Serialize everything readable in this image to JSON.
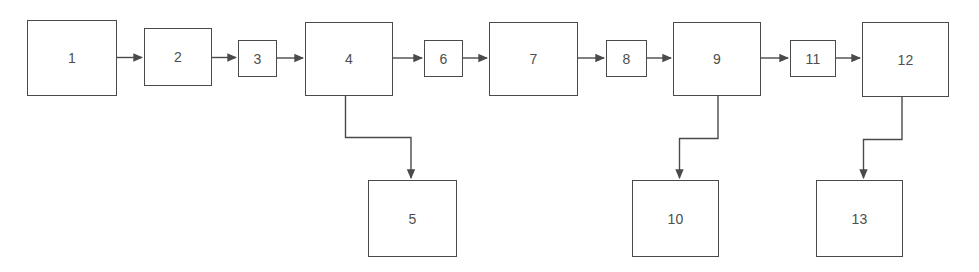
{
  "diagram": {
    "type": "flowchart",
    "orientation": "left-to-right with downward branches",
    "background_color": "#ffffff",
    "line_color": "#4a4a4a",
    "text_color": "#4e4e4e",
    "nodes": [
      {
        "id": "n1",
        "label": "1",
        "x": 27,
        "y": 20,
        "w": 90,
        "h": 76,
        "shape": "rectangle"
      },
      {
        "id": "n2",
        "label": "2",
        "x": 144,
        "y": 28,
        "w": 68,
        "h": 58,
        "shape": "rectangle"
      },
      {
        "id": "n3",
        "label": "3",
        "x": 238,
        "y": 40,
        "w": 39,
        "h": 37,
        "shape": "rectangle"
      },
      {
        "id": "n4",
        "label": "4",
        "x": 305,
        "y": 22,
        "w": 88,
        "h": 74,
        "shape": "rectangle"
      },
      {
        "id": "n5",
        "label": "5",
        "x": 368,
        "y": 180,
        "w": 89,
        "h": 77,
        "shape": "rectangle"
      },
      {
        "id": "n6",
        "label": "6",
        "x": 424,
        "y": 40,
        "w": 39,
        "h": 37,
        "shape": "rectangle"
      },
      {
        "id": "n7",
        "label": "7",
        "x": 489,
        "y": 22,
        "w": 89,
        "h": 74,
        "shape": "rectangle"
      },
      {
        "id": "n8",
        "label": "8",
        "x": 606,
        "y": 40,
        "w": 41,
        "h": 37,
        "shape": "rectangle"
      },
      {
        "id": "n9",
        "label": "9",
        "x": 673,
        "y": 22,
        "w": 88,
        "h": 74,
        "shape": "rectangle"
      },
      {
        "id": "n10",
        "label": "10",
        "x": 632,
        "y": 180,
        "w": 87,
        "h": 77,
        "shape": "rectangle"
      },
      {
        "id": "n11",
        "label": "11",
        "x": 790,
        "y": 40,
        "w": 46,
        "h": 37,
        "shape": "rectangle"
      },
      {
        "id": "n12",
        "label": "12",
        "x": 862,
        "y": 22,
        "w": 87,
        "h": 75,
        "shape": "rectangle"
      },
      {
        "id": "n13",
        "label": "13",
        "x": 816,
        "y": 180,
        "w": 87,
        "h": 77,
        "shape": "rectangle"
      }
    ],
    "edges": [
      {
        "id": "e1",
        "from": "n1",
        "to": "n2",
        "kind": "straight-horizontal",
        "arrow": true
      },
      {
        "id": "e2",
        "from": "n2",
        "to": "n3",
        "kind": "straight-horizontal",
        "arrow": true
      },
      {
        "id": "e3",
        "from": "n3",
        "to": "n4",
        "kind": "straight-horizontal",
        "arrow": true
      },
      {
        "id": "e4",
        "from": "n4",
        "to": "n6",
        "kind": "straight-horizontal",
        "arrow": true
      },
      {
        "id": "e5",
        "from": "n6",
        "to": "n7",
        "kind": "straight-horizontal",
        "arrow": true
      },
      {
        "id": "e6",
        "from": "n7",
        "to": "n8",
        "kind": "straight-horizontal",
        "arrow": true
      },
      {
        "id": "e7",
        "from": "n8",
        "to": "n9",
        "kind": "straight-horizontal",
        "arrow": true
      },
      {
        "id": "e8",
        "from": "n9",
        "to": "n11",
        "kind": "straight-horizontal",
        "arrow": true
      },
      {
        "id": "e9",
        "from": "n11",
        "to": "n12",
        "kind": "straight-horizontal",
        "arrow": true
      },
      {
        "id": "e10",
        "from": "n4",
        "to": "n5",
        "kind": "elbow-down-right",
        "arrow": true
      },
      {
        "id": "e11",
        "from": "n9",
        "to": "n10",
        "kind": "elbow-down-left",
        "arrow": true
      },
      {
        "id": "e12",
        "from": "n12",
        "to": "n13",
        "kind": "elbow-down-left",
        "arrow": true
      }
    ]
  }
}
